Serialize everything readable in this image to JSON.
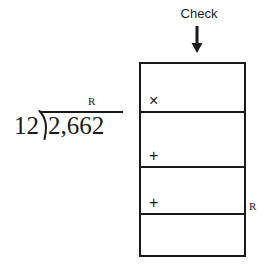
{
  "division": {
    "divisor": "12",
    "dividend": "2,662",
    "remainder_label": "R",
    "bracket_icon": "division-bracket-icon",
    "vinculum_icon": "vinculum-line"
  },
  "check": {
    "label": "Check",
    "arrow_icon": "arrow-down-icon",
    "remainder_label": "R",
    "rows": [
      {
        "operator": "×",
        "operator_name": "multiply",
        "value": ""
      },
      {
        "operator": "+",
        "operator_name": "plus",
        "value": ""
      },
      {
        "operator": "+",
        "operator_name": "plus",
        "value": ""
      },
      {
        "operator": "",
        "operator_name": "none",
        "value": ""
      }
    ]
  },
  "colors": {
    "ink": "#1a1a1a",
    "paper": "#ffffff"
  }
}
